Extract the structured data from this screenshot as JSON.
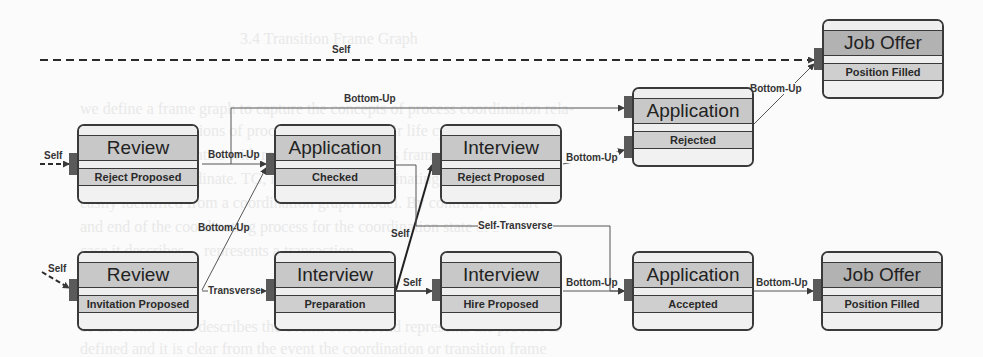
{
  "diagram": {
    "type": "state-transition-graph",
    "nodes": [
      {
        "id": "review_reject",
        "title": "Review",
        "state": "Reject Proposed"
      },
      {
        "id": "application_checked",
        "title": "Application",
        "state": "Checked"
      },
      {
        "id": "interview_reject",
        "title": "Interview",
        "state": "Reject Proposed"
      },
      {
        "id": "application_rejected",
        "title": "Application",
        "state": "Rejected"
      },
      {
        "id": "joboffer_top",
        "title": "Job Offer",
        "state": "Position Filled"
      },
      {
        "id": "review_invitation",
        "title": "Review",
        "state": "Invitation Proposed"
      },
      {
        "id": "interview_preparation",
        "title": "Interview",
        "state": "Preparation"
      },
      {
        "id": "interview_hire",
        "title": "Interview",
        "state": "Hire Proposed"
      },
      {
        "id": "application_accepted",
        "title": "Application",
        "state": "Accepted"
      },
      {
        "id": "joboffer_bottom",
        "title": "Job Offer",
        "state": "Position Filled"
      }
    ],
    "edges": [
      {
        "from": "start",
        "to": "joboffer_top",
        "label": "Self",
        "style": "dashed"
      },
      {
        "from": "start",
        "to": "review_reject",
        "label": "Self",
        "style": "dashed"
      },
      {
        "from": "start",
        "to": "review_invitation",
        "label": "Self",
        "style": "dashed"
      },
      {
        "from": "review_reject",
        "to": "application_checked",
        "label": "Bottom-Up"
      },
      {
        "from": "review_reject",
        "to": "application_rejected",
        "label": "Bottom-Up"
      },
      {
        "from": "review_invitation",
        "to": "application_checked",
        "label": "Bottom-Up"
      },
      {
        "from": "review_invitation",
        "to": "interview_preparation",
        "label": "Transverse"
      },
      {
        "from": "interview_preparation",
        "to": "interview_reject",
        "label": "Self"
      },
      {
        "from": "interview_preparation",
        "to": "interview_hire",
        "label": "Self"
      },
      {
        "from": "application_checked",
        "to": "application_accepted",
        "label": "Self-Transverse"
      },
      {
        "from": "interview_reject",
        "to": "application_rejected",
        "label": "Bottom-Up"
      },
      {
        "from": "application_rejected",
        "to": "joboffer_top",
        "label": "Bottom-Up"
      },
      {
        "from": "interview_hire",
        "to": "application_accepted",
        "label": "Bottom-Up"
      },
      {
        "from": "application_accepted",
        "to": "joboffer_bottom",
        "label": "Bottom-Up"
      }
    ]
  },
  "labels": {
    "self_top": "Self",
    "self_review_reject": "Self",
    "self_review_invitation": "Self",
    "bu_review_to_app_checked": "Bottom-Up",
    "bu_top_long": "Bottom-Up",
    "bu_review_inv_to_app": "Bottom-Up",
    "transverse": "Transverse",
    "self_diag": "Self",
    "self_horizontal": "Self",
    "self_transverse": "Self-Transverse",
    "bu_interview_to_app_rejected": "Bottom-Up",
    "bu_app_rejected_to_job": "Bottom-Up",
    "bu_interview_hire_to_app": "Bottom-Up",
    "bu_app_accepted_to_job": "Bottom-Up"
  },
  "background_text": [
    "3.4 Transition Frame Graph",
    "we define a frame graph to capture the concepts of process coordination rela-",
    "ing to essential actions of process frames and their life cycle states and",
    "type, and its semantics with respect to the process frames. A process frame",
    "is allowed to coordinate. TG, its role in the coordinating process can be",
    "easily identified from a coordination graph model. By contrast, the start",
    "and end of the coordinating process for the coordination state at a",
    "case it describes..., represents a transaction.",
    "of an event which describes the event. The second represents the process is",
    "defined and it is clear from the event the coordination or transition frame"
  ],
  "colors": {
    "line": "#3a3a3a",
    "title_fill": "#c8c8c8",
    "title_fill_dark": "#b2b2b2",
    "state_fill": "#cfcfcf",
    "port": "#5a5a5a"
  }
}
